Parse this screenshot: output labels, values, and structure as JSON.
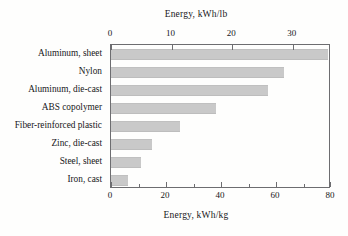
{
  "chart_data": {
    "type": "bar",
    "orientation": "horizontal",
    "title": "",
    "categories": [
      "Aluminum, sheet",
      "Nylon",
      "Aluminum, die-cast",
      "ABS copolymer",
      "Fiber-reinforced plastic",
      "Zinc, die-cast",
      "Steel, sheet",
      "Iron, cast"
    ],
    "values": [
      79,
      63,
      57,
      38,
      25,
      15,
      11,
      6
    ],
    "xlabel": "Energy, kWh/kg",
    "xlabel_top": "Energy, kWh/lb",
    "ylabel": "",
    "xlim": [
      0,
      80
    ],
    "xlim_top": [
      0,
      36.29
    ],
    "xticks": [
      0,
      20,
      40,
      60,
      80
    ],
    "xticks_minor": [
      10,
      30,
      50,
      70
    ],
    "xtick_labels": [
      "0",
      "20",
      "40",
      "60",
      "80"
    ],
    "xticks_top": [
      0,
      10,
      20,
      30
    ],
    "xtick_top_labels": [
      "0",
      "10",
      "20",
      "30"
    ],
    "grid": false,
    "legend": false,
    "bar_color": "#c9c9c9",
    "axis_color": "#6d6d70",
    "background": "#fefefd"
  },
  "axes": {
    "top_title": "Energy, kWh/lb",
    "bottom_title": "Energy, kWh/kg"
  }
}
